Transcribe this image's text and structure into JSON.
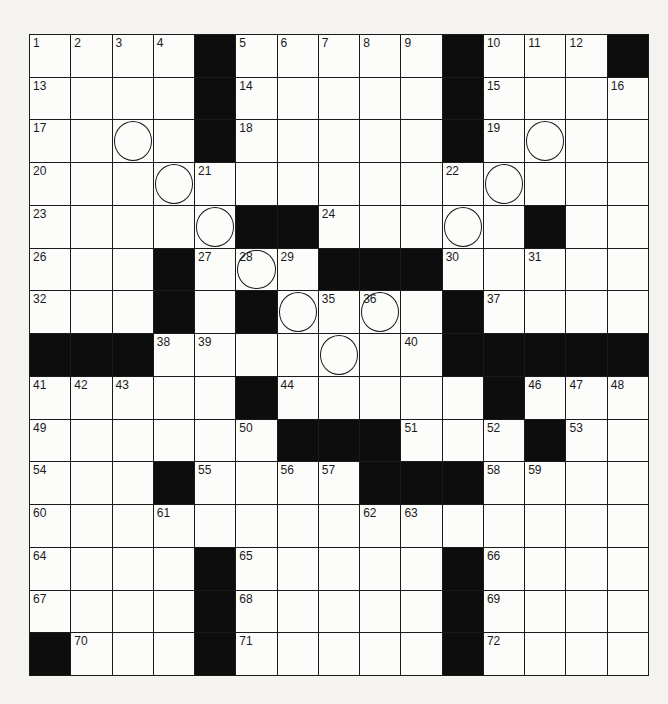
{
  "puzzle": {
    "rows": 15,
    "cols": 15,
    "layout": [
      "....#.....#...#",
      "....#.....#....",
      "....#.....#....",
      "...............",
      ".....##.....#..",
      "...#...###.....",
      "...#.#....#....",
      "###.......#####",
      ".....#.....#...",
      "......###...#..",
      "...#....###....",
      "...............",
      "....#.....#....",
      "....#.....#....",
      "#...#.....#...."
    ],
    "numbers": [
      [
        1,
        2,
        3,
        4,
        0,
        5,
        6,
        7,
        8,
        9,
        0,
        10,
        11,
        12,
        0
      ],
      [
        13,
        0,
        0,
        0,
        0,
        14,
        0,
        0,
        0,
        0,
        0,
        15,
        0,
        0,
        16
      ],
      [
        17,
        0,
        0,
        0,
        0,
        18,
        0,
        0,
        0,
        0,
        0,
        19,
        0,
        0,
        0
      ],
      [
        20,
        0,
        0,
        0,
        21,
        0,
        0,
        0,
        0,
        0,
        22,
        0,
        0,
        0,
        0
      ],
      [
        23,
        0,
        0,
        0,
        0,
        0,
        0,
        24,
        0,
        0,
        0,
        0,
        25,
        0,
        0
      ],
      [
        26,
        0,
        0,
        0,
        27,
        28,
        29,
        0,
        0,
        0,
        30,
        0,
        31,
        0,
        0
      ],
      [
        32,
        0,
        0,
        33,
        0,
        34,
        0,
        35,
        36,
        0,
        0,
        37,
        0,
        0,
        0
      ],
      [
        0,
        0,
        0,
        38,
        39,
        0,
        0,
        0,
        0,
        40,
        0,
        0,
        0,
        0,
        0
      ],
      [
        41,
        42,
        43,
        0,
        0,
        0,
        44,
        0,
        0,
        0,
        0,
        45,
        46,
        47,
        48
      ],
      [
        49,
        0,
        0,
        0,
        0,
        50,
        0,
        0,
        0,
        51,
        0,
        52,
        0,
        53,
        0
      ],
      [
        54,
        0,
        0,
        0,
        55,
        0,
        56,
        57,
        0,
        0,
        0,
        58,
        59,
        0,
        0
      ],
      [
        60,
        0,
        0,
        61,
        0,
        0,
        0,
        0,
        62,
        63,
        0,
        0,
        0,
        0,
        0
      ],
      [
        64,
        0,
        0,
        0,
        0,
        65,
        0,
        0,
        0,
        0,
        0,
        66,
        0,
        0,
        0
      ],
      [
        67,
        0,
        0,
        0,
        0,
        68,
        0,
        0,
        0,
        0,
        0,
        69,
        0,
        0,
        0
      ],
      [
        0,
        70,
        0,
        0,
        0,
        71,
        0,
        0,
        0,
        0,
        0,
        72,
        0,
        0,
        0
      ]
    ],
    "circles": [
      [
        2,
        2
      ],
      [
        2,
        12
      ],
      [
        3,
        3
      ],
      [
        3,
        11
      ],
      [
        4,
        4
      ],
      [
        4,
        10
      ],
      [
        5,
        5
      ],
      [
        5,
        9
      ],
      [
        6,
        6
      ],
      [
        6,
        8
      ],
      [
        7,
        7
      ]
    ]
  }
}
